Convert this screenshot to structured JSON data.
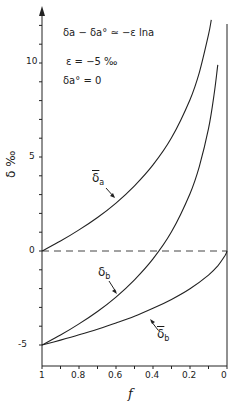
{
  "chart_data": {
    "type": "line",
    "title": "",
    "xlabel": "f",
    "ylabel": "δ ‰",
    "xlim": [
      1,
      0
    ],
    "ylim": [
      -6.2,
      12.9
    ],
    "x_ticks": [
      "1",
      "0.8",
      "0.6",
      "0.4",
      "0.2",
      "0"
    ],
    "y_ticks": [
      "10",
      "5",
      "0",
      "-5"
    ],
    "grid": false,
    "annotations": [
      "δa − δa° ≃ −ε lna",
      "ε = −5 ‰",
      "δa° = 0"
    ],
    "reference_line": {
      "y": 0,
      "style": "dashed"
    },
    "series": [
      {
        "name": "δ̄a",
        "x": [
          1,
          0.9,
          0.8,
          0.7,
          0.6,
          0.5,
          0.4,
          0.3,
          0.2,
          0.15,
          0.1,
          0.085
        ],
        "values": [
          0,
          0.53,
          1.12,
          1.78,
          2.55,
          3.47,
          4.58,
          6.02,
          8.05,
          9.49,
          11.51,
          12.3
        ]
      },
      {
        "name": "δb",
        "x": [
          1,
          0.9,
          0.8,
          0.7,
          0.6,
          0.5,
          0.4,
          0.3,
          0.2,
          0.15,
          0.1,
          0.07,
          0.05
        ],
        "values": [
          -5,
          -4.47,
          -3.88,
          -3.22,
          -2.45,
          -1.53,
          -0.42,
          1.02,
          3.05,
          4.49,
          6.51,
          8.3,
          9.9
        ]
      },
      {
        "name": "δ̄b",
        "x": [
          1,
          0.9,
          0.8,
          0.7,
          0.6,
          0.5,
          0.4,
          0.3,
          0.2,
          0.1,
          0.05,
          0.01,
          0
        ],
        "values": [
          -5,
          -4.74,
          -4.46,
          -4.16,
          -3.83,
          -3.47,
          -3.05,
          -2.58,
          -2.01,
          -1.28,
          -0.79,
          -0.23,
          0
        ]
      }
    ]
  },
  "labels": {
    "eq1": "δa − δa° ≃ −ε lna",
    "eq2": "ε = −5 ‰",
    "eq3": "δa° = 0",
    "ylabel": "δ ‰",
    "xlabel": "f",
    "curve_delta_a_bar": "δ",
    "curve_delta_a_bar_sub": "a",
    "curve_delta_b": "δ",
    "curve_delta_b_sub": "b",
    "curve_delta_b_bar": "δ",
    "curve_delta_b_bar_sub": "b"
  },
  "ticks": {
    "x": [
      "1",
      "0.8",
      "0.6",
      "0.4",
      "0.2",
      "0"
    ],
    "y": [
      "10",
      "5",
      "0",
      "-5"
    ]
  }
}
